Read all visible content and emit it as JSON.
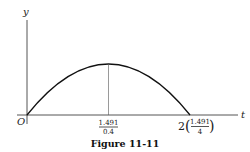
{
  "figure": {
    "caption": "Figure 11-11",
    "axes": {
      "x_label": "t",
      "y_label": "y",
      "origin_label": "O"
    },
    "ticks": {
      "peak": {
        "numerator": "1.491",
        "denominator": "0.4"
      },
      "end": {
        "coefficient": "2",
        "numerator": "1.491",
        "denominator": "4"
      }
    },
    "curve": {
      "shape": "parabolic arc",
      "start": "origin",
      "peak_at": "1.491/0.4",
      "end_at": "2(1.491/4)"
    }
  }
}
